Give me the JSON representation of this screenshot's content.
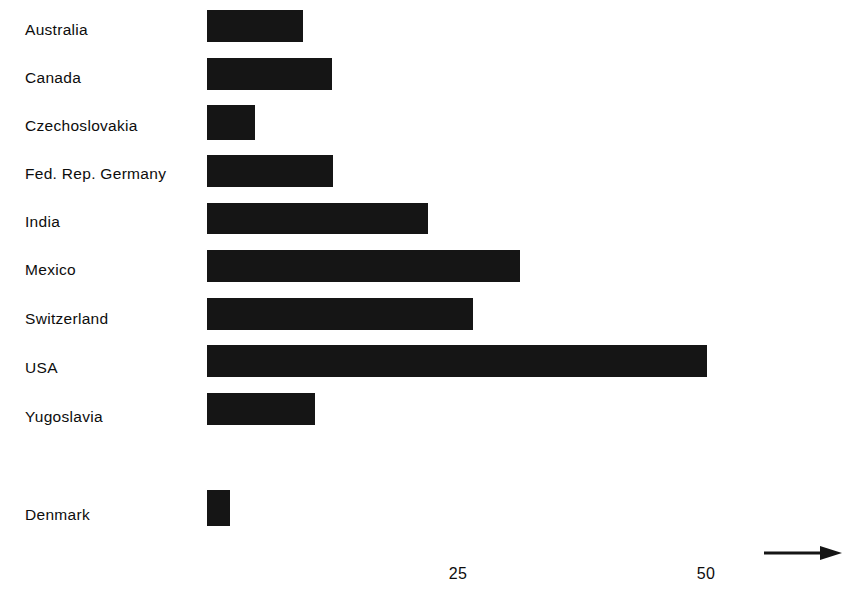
{
  "chart_data": {
    "type": "bar",
    "orientation": "horizontal",
    "title": "",
    "subtitle": "",
    "xlabel": "",
    "ylabel": "",
    "categories": [
      "Australia",
      "Canada",
      "Czechoslovakia",
      "Fed. Rep. Germany",
      "India",
      "Mexico",
      "Switzerland",
      "USA",
      "Yugoslavia",
      "Denmark"
    ],
    "values": [
      9.6,
      12.5,
      4.8,
      12.6,
      22.1,
      31.4,
      26.7,
      50.1,
      10.8,
      2.3
    ],
    "series": [
      {
        "name": "",
        "values": [
          9.6,
          12.5,
          4.8,
          12.6,
          22.1,
          31.4,
          26.7,
          50.1,
          10.8,
          2.3
        ]
      }
    ],
    "xlim": [
      0,
      64
    ],
    "ylim": null,
    "xticks": [
      25,
      50
    ],
    "xtick_labels": [
      "25",
      "50"
    ],
    "yticks": [],
    "grid": false,
    "legend": null,
    "legend_position": "none",
    "annotations": [
      "axis-arrow"
    ],
    "bar_color": "#151515",
    "background_color": "#ffffff",
    "text_color": "#0d0d0d",
    "note": "Denmark is separated from the main group by a gap; its bar is drawn narrower and taller than the others."
  },
  "axis": {
    "tick_25": "25",
    "tick_50": "50",
    "arrow_icon": "right-arrow-icon"
  },
  "bars": [
    {
      "label": "Australia",
      "value": 9.6,
      "label_y": 22,
      "bar_top": 10,
      "bar_height": 32,
      "bar_left": 207,
      "bar_width": 96
    },
    {
      "label": "Canada",
      "value": 12.5,
      "label_y": 70,
      "bar_top": 58,
      "bar_height": 32,
      "bar_left": 207,
      "bar_width": 125
    },
    {
      "label": "Czechoslovakia",
      "value": 4.8,
      "label_y": 118,
      "bar_top": 105,
      "bar_height": 35,
      "bar_left": 207,
      "bar_width": 48
    },
    {
      "label": "Fed. Rep. Germany",
      "value": 12.6,
      "label_y": 166,
      "bar_top": 155,
      "bar_height": 32,
      "bar_left": 207,
      "bar_width": 126
    },
    {
      "label": "India",
      "value": 22.1,
      "label_y": 214,
      "bar_top": 203,
      "bar_height": 31,
      "bar_left": 207,
      "bar_width": 221
    },
    {
      "label": "Mexico",
      "value": 31.4,
      "label_y": 262,
      "bar_top": 250,
      "bar_height": 32,
      "bar_left": 207,
      "bar_width": 313
    },
    {
      "label": "Switzerland",
      "value": 26.7,
      "label_y": 311,
      "bar_top": 298,
      "bar_height": 32,
      "bar_left": 207,
      "bar_width": 266
    },
    {
      "label": "USA",
      "value": 50.1,
      "label_y": 360,
      "bar_top": 345,
      "bar_height": 32,
      "bar_left": 207,
      "bar_width": 500
    },
    {
      "label": "Yugoslavia",
      "value": 10.8,
      "label_y": 409,
      "bar_top": 393,
      "bar_height": 32,
      "bar_left": 207,
      "bar_width": 108
    },
    {
      "label": "Denmark",
      "value": 2.3,
      "label_y": 507,
      "bar_top": 490,
      "bar_height": 36,
      "bar_left": 207,
      "bar_width": 23
    }
  ],
  "ticks": [
    {
      "label": "25",
      "left": 428,
      "top": 566,
      "width": 60
    },
    {
      "label": "50",
      "left": 676,
      "top": 566,
      "width": 60
    }
  ]
}
